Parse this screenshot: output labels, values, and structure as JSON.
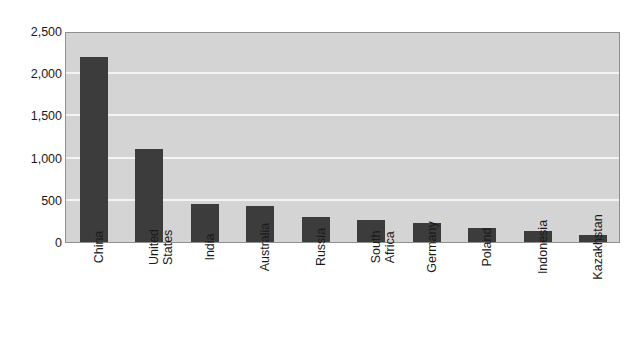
{
  "chart_data": {
    "type": "bar",
    "title": "",
    "subtitle": "",
    "xlabel": "",
    "ylabel": "",
    "ylim": [
      0,
      2500
    ],
    "ytick_step": 500,
    "grid": true,
    "legend": "none",
    "orientation": "vertical",
    "bar_color": "#3c3c3c",
    "plot_background": "#d4d4d4",
    "gridline_color": "#f4f4f4",
    "axis_color": "#8f8f8f",
    "categories": [
      "China",
      "United\nStates",
      "India",
      "Australia",
      "Russia",
      "South\nAfrica",
      "Germany",
      "Poland",
      "Indonesia",
      "Kazakhstan"
    ],
    "values": [
      2190,
      1105,
      450,
      430,
      300,
      260,
      225,
      165,
      130,
      85
    ],
    "ytick_labels": [
      "0",
      "500",
      "1,000",
      "1,500",
      "2,000",
      "2,500"
    ],
    "ytick_values": [
      0,
      500,
      1000,
      1500,
      2000,
      2500
    ]
  }
}
